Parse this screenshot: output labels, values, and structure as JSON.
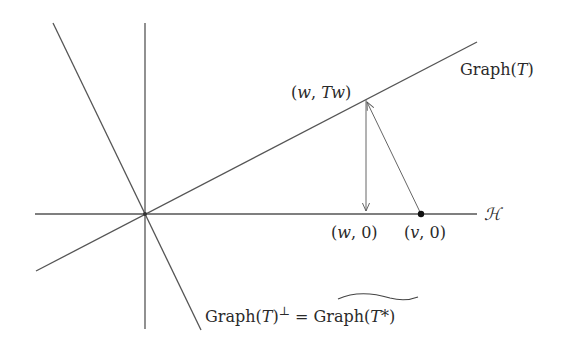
{
  "diagram": {
    "type": "geometric-illustration",
    "stroke_color": "#4a4a4a",
    "axes": {
      "horizontal_label": "ℋ",
      "origin": [
        145,
        214
      ]
    },
    "lines": {
      "graph_T": {
        "label": "Graph(T)",
        "from": [
          36,
          271
        ],
        "to": [
          477,
          42
        ]
      },
      "graph_T_perp": {
        "label_left": "Graph(T)",
        "label_sup": "⊥",
        "label_eq": " = ",
        "label_right_base": "Graph",
        "label_right_arg": "(T*)",
        "from": [
          53,
          23
        ],
        "to": [
          201,
          330
        ]
      }
    },
    "points": {
      "w_Tw": {
        "label": "(w, Tw)",
        "pos": [
          366,
          99
        ]
      },
      "w_0": {
        "label": "(w, 0)",
        "pos": [
          366,
          214
        ]
      },
      "v_0": {
        "label": "(v, 0)",
        "pos": [
          421,
          214
        ]
      }
    },
    "arrows": [
      {
        "name": "projection-down",
        "from": [
          366,
          99
        ],
        "to": [
          366,
          212
        ]
      },
      {
        "name": "v-to-graph",
        "from": [
          421,
          214
        ],
        "to": [
          367,
          101
        ]
      }
    ]
  }
}
